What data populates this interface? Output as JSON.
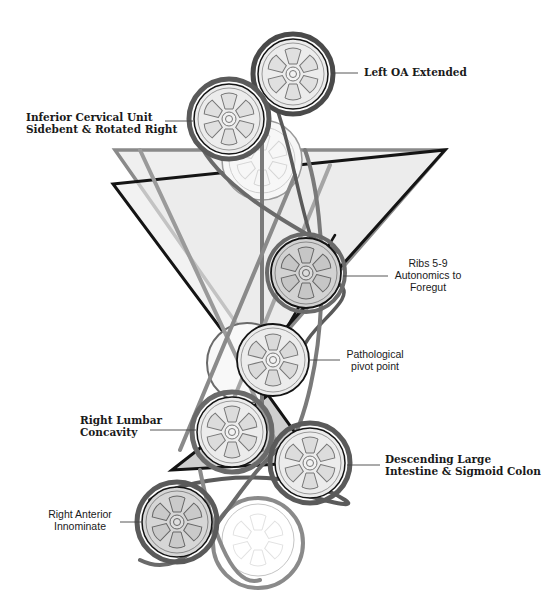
{
  "diagram": {
    "type": "pulley-and-belt biomechanical model",
    "colors": {
      "belt_black": "#141414",
      "belt_dark_gray": "#5a5a5a",
      "belt_mid_gray": "#8a8a8a",
      "belt_light_gray": "#b5b5b5",
      "wheel_fill": "#e6e6e6",
      "wheel_fill_dark": "#cfcfcf",
      "ghost_wheel": "#f4f4f4",
      "triangle_fill": "#ececec",
      "small_triangle_fill": "#cfcfcf"
    }
  },
  "labels": {
    "left_oa": "Left OA Extended",
    "cervical_line1": "Inferior Cervical Unit",
    "cervical_line2": "Sidebent & Rotated Right",
    "ribs_line1": "Ribs 5-9",
    "ribs_line2": "Autonomics to",
    "ribs_line3": "Foregut",
    "pivot_line1": "Pathological",
    "pivot_line2": "pivot point",
    "lumbar_line1": "Right Lumbar",
    "lumbar_line2": "Concavity",
    "colon_line1": "Descending Large",
    "colon_line2": "Intestine & Sigmoid Colon",
    "innominate_line1": "Right Anterior",
    "innominate_line2": "Innominate"
  },
  "wheels": [
    {
      "id": "left-oa",
      "cx": 293,
      "cy": 74,
      "r": 36
    },
    {
      "id": "inferior-cervical",
      "cx": 229,
      "cy": 119,
      "r": 36
    },
    {
      "id": "ribs-5-9",
      "cx": 306,
      "cy": 273,
      "r": 35
    },
    {
      "id": "pivot",
      "cx": 273,
      "cy": 360,
      "r": 35
    },
    {
      "id": "right-lumbar",
      "cx": 232,
      "cy": 432,
      "r": 35
    },
    {
      "id": "descending-colon",
      "cx": 310,
      "cy": 463,
      "r": 35
    },
    {
      "id": "right-anterior-innominate",
      "cx": 177,
      "cy": 522,
      "r": 35
    }
  ]
}
